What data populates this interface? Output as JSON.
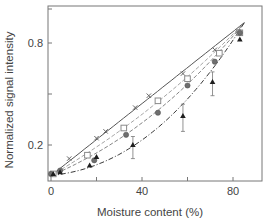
{
  "chart_data": {
    "type": "line",
    "title": "",
    "xlabel": "Moisture content (%)",
    "ylabel": "Normalized signal intensity",
    "xlim": [
      -1,
      91
    ],
    "ylim": [
      0,
      1.02
    ],
    "xticks": [
      0,
      20,
      40,
      60,
      80
    ],
    "xtick_labels": [
      "0",
      "",
      "40",
      "",
      "80"
    ],
    "yticks": [
      0.2,
      0.5,
      0.8,
      1.0
    ],
    "ytick_labels": [
      "0.2",
      "",
      "0.8",
      ""
    ],
    "grid": false,
    "legend": "none",
    "series": [
      {
        "name": "series-x-solid",
        "marker": "x",
        "line": "solid",
        "color": "#555555",
        "fit": [
          [
            0,
            0.02
          ],
          [
            85,
            0.92
          ]
        ],
        "points": [
          {
            "x": 0,
            "y": 0.03
          },
          {
            "x": 8,
            "y": 0.12
          },
          {
            "x": 20,
            "y": 0.24
          },
          {
            "x": 24,
            "y": 0.28
          },
          {
            "x": 37,
            "y": 0.42
          },
          {
            "x": 43,
            "y": 0.49
          },
          {
            "x": 58,
            "y": 0.62
          },
          {
            "x": 72,
            "y": 0.76
          },
          {
            "x": 82,
            "y": 0.87
          }
        ]
      },
      {
        "name": "series-open-square",
        "marker": "square-open",
        "line": "dashed",
        "color": "#9a9a9a",
        "fit": [
          [
            0,
            0.02
          ],
          [
            85,
            0.92
          ]
        ],
        "curve": 0.25,
        "points": [
          {
            "x": 1,
            "y": 0.03
          },
          {
            "x": 16,
            "y": 0.14
          },
          {
            "x": 32,
            "y": 0.3
          },
          {
            "x": 47,
            "y": 0.46
          },
          {
            "x": 60,
            "y": 0.59
          },
          {
            "x": 74,
            "y": 0.74
          },
          {
            "x": 83,
            "y": 0.86
          }
        ]
      },
      {
        "name": "series-filled-circle",
        "marker": "circle-filled",
        "line": "dashed",
        "color": "#777777",
        "fit": [
          [
            0,
            0.02
          ],
          [
            85,
            0.92
          ]
        ],
        "curve": 0.45,
        "points": [
          {
            "x": 0,
            "y": 0.03
          },
          {
            "x": 4,
            "y": 0.05
          },
          {
            "x": 19,
            "y": 0.11
          },
          {
            "x": 33,
            "y": 0.26
          },
          {
            "x": 47,
            "y": 0.39
          },
          {
            "x": 60,
            "y": 0.55
          },
          {
            "x": 72,
            "y": 0.69
          },
          {
            "x": 83,
            "y": 0.86
          }
        ]
      },
      {
        "name": "series-filled-triangle",
        "marker": "triangle-filled",
        "line": "dash-dot",
        "color": "#222222",
        "fit": [
          [
            0,
            0.02
          ],
          [
            85,
            0.92
          ]
        ],
        "curve": 0.85,
        "points": [
          {
            "x": 1,
            "y": 0.03
          },
          {
            "x": 4,
            "y": 0.04
          },
          {
            "x": 17,
            "y": 0.08
          },
          {
            "x": 20,
            "y": 0.13
          },
          {
            "x": 36,
            "y": 0.2
          },
          {
            "x": 58,
            "y": 0.37
          },
          {
            "x": 71,
            "y": 0.57
          },
          {
            "x": 83,
            "y": 0.82
          }
        ],
        "error_bars": [
          {
            "x": 36,
            "low": 0.12,
            "high": 0.25
          },
          {
            "x": 58,
            "low": 0.28,
            "high": 0.44
          },
          {
            "x": 71,
            "low": 0.49,
            "high": 0.63
          }
        ]
      }
    ]
  }
}
